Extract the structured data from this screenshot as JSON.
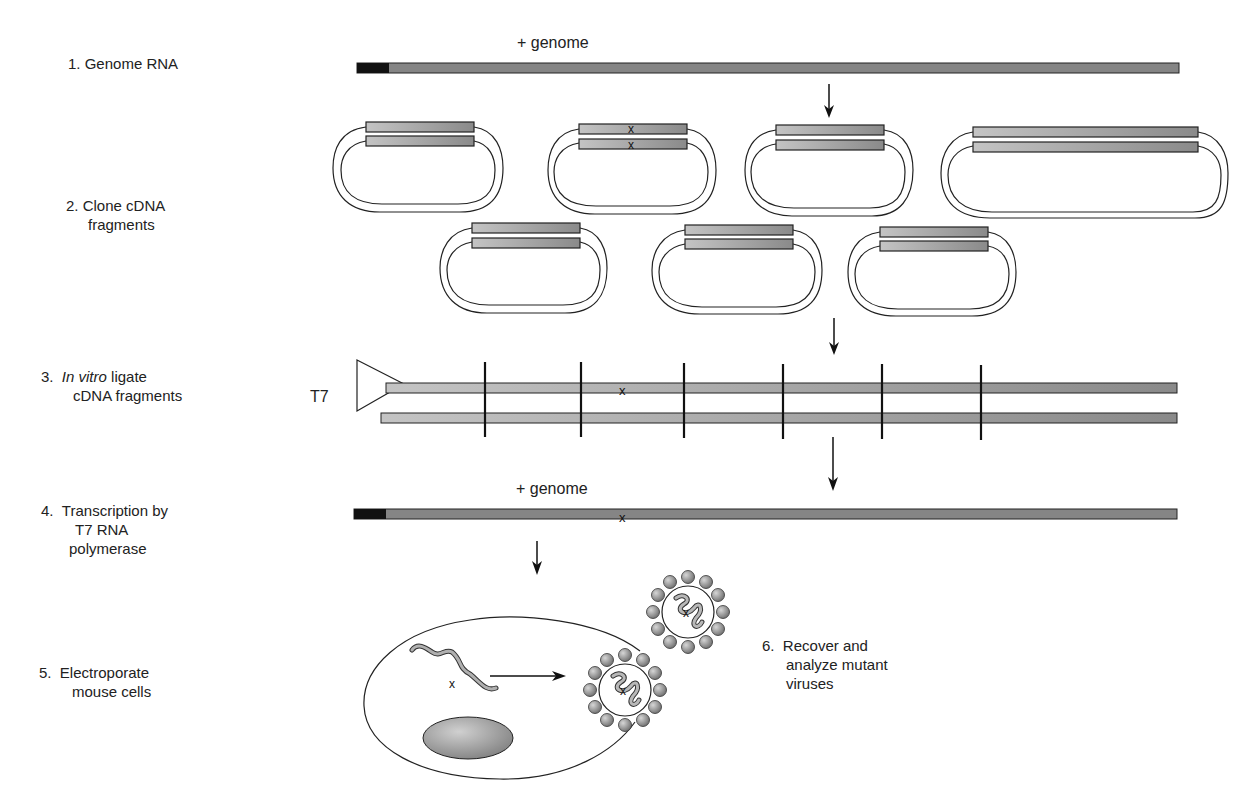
{
  "steps": [
    {
      "number": "1.",
      "lines": [
        "Genome RNA"
      ]
    },
    {
      "number": "2.",
      "lines": [
        "Clone cDNA",
        "fragments"
      ]
    },
    {
      "number": "3.",
      "italic_prefix": "In vitro",
      "lines": [
        " ligate",
        "cDNA fragments"
      ]
    },
    {
      "number": "4.",
      "lines": [
        "Transcription by",
        "T7 RNA",
        "polymerase"
      ]
    },
    {
      "number": "5.",
      "lines": [
        "Electroporate",
        "mouse cells"
      ]
    },
    {
      "number": "6.",
      "lines": [
        "Recover and",
        "analyze mutant",
        "viruses"
      ]
    }
  ],
  "labels": {
    "genome_top": "+ genome",
    "genome_bottom": "+ genome",
    "promoter": "T7",
    "mutation_mark": "x"
  },
  "colors": {
    "strand_dark": "#7a7a7a",
    "strand_light": "#b8b8b8",
    "cap_black": "#111111",
    "outline": "#222222",
    "nucleus": "#9a9a9a",
    "capsid_sphere": "#8c8c8c"
  }
}
